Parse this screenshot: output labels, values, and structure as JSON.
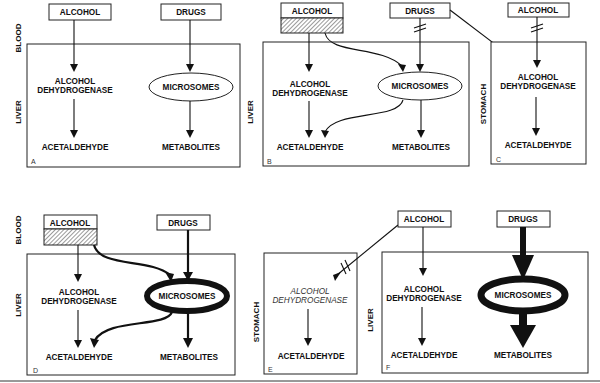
{
  "labels": {
    "blood": "BLOOD",
    "liver": "LIVER",
    "stomach": "STOMACH",
    "alcohol": "ALCOHOL",
    "drugs": "DRUGS",
    "adh_line1": "ALCOHOL",
    "adh_line2": "DEHYDROGENASE",
    "microsomes": "MICROSOMES",
    "acetaldehyde": "ACETALDEHYDE",
    "metabolites": "METABOLITES"
  },
  "panels": [
    {
      "id": "A",
      "compartment": "LIVER",
      "note": "Normal: alcohol via ADH, drugs via microsomes"
    },
    {
      "id": "B",
      "compartment": "LIVER",
      "note": "Alcohol (hatched) also routed to microsomes; drug access to microsomes blocked"
    },
    {
      "id": "C",
      "compartment": "STOMACH",
      "note": "Gastric ADH; drug inhibits alcohol entry"
    },
    {
      "id": "D",
      "compartment": "LIVER",
      "note": "Induced microsomes (thick); enhanced alcohol and drug metabolism"
    },
    {
      "id": "E",
      "compartment": "STOMACH",
      "note": "Gastric ADH (italic, reduced) with blocked input"
    },
    {
      "id": "F",
      "compartment": "LIVER",
      "note": "Heavy drug flux through induced microsomes"
    }
  ],
  "panel_letters": [
    "A",
    "B",
    "C",
    "D",
    "E",
    "F"
  ],
  "colors": {
    "line": "#111111",
    "background": "#ffffff",
    "hatch": "#555555"
  }
}
